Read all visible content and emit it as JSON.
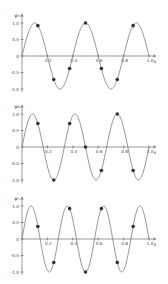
{
  "chart_data": [
    {
      "type": "line",
      "title": "",
      "ylabel": "ψ₅",
      "xlabel": "x",
      "function": "sin(5πx)",
      "frequency": 5,
      "xlim": [
        0,
        1.0
      ],
      "ylim": [
        -1.0,
        1.0
      ],
      "xticks": [
        "0.2",
        "0.4",
        "0.6",
        "0.8",
        "1.0"
      ],
      "yticks": [
        "1.0",
        "0.5",
        "0",
        "-0.5",
        "-1.0"
      ],
      "grid": false,
      "sample_points": {
        "x": [
          0.125,
          0.25,
          0.375,
          0.5,
          0.625,
          0.75,
          0.875
        ],
        "y": [
          0.92,
          -0.71,
          -0.38,
          1.0,
          -0.38,
          -0.71,
          0.92
        ]
      }
    },
    {
      "type": "line",
      "title": "",
      "ylabel": "ψ₆",
      "xlabel": "x",
      "function": "sin(6πx)",
      "frequency": 6,
      "xlim": [
        0,
        1.0
      ],
      "ylim": [
        -1.0,
        1.0
      ],
      "xticks": [
        "0.2",
        "0.4",
        "0.6",
        "0.8",
        "1.0"
      ],
      "yticks": [
        "1.0",
        "0.5",
        "0",
        "-0.5",
        "-1.0"
      ],
      "grid": false,
      "sample_points": {
        "x": [
          0.125,
          0.25,
          0.375,
          0.5,
          0.625,
          0.75,
          0.875
        ],
        "y": [
          0.71,
          -1.0,
          0.71,
          0.0,
          -0.71,
          1.0,
          -0.71
        ]
      }
    },
    {
      "type": "line",
      "title": "",
      "ylabel": "ψ₇",
      "xlabel": "x",
      "function": "sin(7πx)",
      "frequency": 7,
      "xlim": [
        0,
        1.0
      ],
      "ylim": [
        -1.0,
        1.0
      ],
      "xticks": [
        "0.2",
        "0.4",
        "0.6",
        "0.8",
        "1.0"
      ],
      "yticks": [
        "1.0",
        "0.5",
        "0",
        "-0.5",
        "-1.0"
      ],
      "grid": false,
      "sample_points": {
        "x": [
          0.125,
          0.25,
          0.375,
          0.5,
          0.625,
          0.75,
          0.875
        ],
        "y": [
          0.38,
          -0.71,
          0.92,
          -1.0,
          0.92,
          -0.71,
          0.38
        ]
      }
    }
  ],
  "layout": {
    "panels": [
      {
        "zeroY": 56,
        "top": 14
      },
      {
        "zeroY": 147,
        "top": 105
      },
      {
        "zeroY": 239,
        "top": 199
      }
    ],
    "x0": 22,
    "x1": 149,
    "amp": 33,
    "colors": {
      "curve": "#777777",
      "axis": "#555555",
      "point": "#333333"
    }
  }
}
